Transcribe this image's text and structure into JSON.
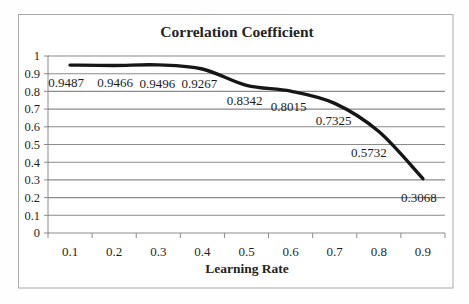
{
  "chart_data": {
    "type": "line",
    "title": "Correlation Coefficient",
    "xlabel": "Learning Rate",
    "ylabel": "",
    "categories": [
      "0.1",
      "0.2",
      "0.3",
      "0.4",
      "0.5",
      "0.6",
      "0.7",
      "0.8",
      "0.9"
    ],
    "values": [
      0.9487,
      0.9466,
      0.9496,
      0.9267,
      0.8342,
      0.8015,
      0.7325,
      0.5732,
      0.3068
    ],
    "data_labels": [
      "0.9487",
      "0.9466",
      "0.9496",
      "0.9267",
      "0.8342",
      "0.8015",
      "0.7325",
      "0.5732",
      "0.3068"
    ],
    "data_label_colors": [
      "#1c1c1c",
      "#1c1c1c",
      "#8e8e88",
      "#1c1c1c",
      "#1c1c1c",
      "#1c1c1c",
      "#1c1c1c",
      "#1c1c1c",
      "#1c1c1c"
    ],
    "yticks": [
      "0",
      "0.1",
      "0.2",
      "0.3",
      "0.4",
      "0.5",
      "0.6",
      "0.7",
      "0.8",
      "0.9",
      "1"
    ],
    "ylim": [
      0,
      1
    ],
    "grid": "horizontal",
    "legend": "none",
    "smoothed": true,
    "line_color": "#161616",
    "grid_color": "#8b8b8b",
    "axis_color": "#8b8b8b",
    "frame_color": "#a9a9a9",
    "background_color": "#fefefe"
  }
}
